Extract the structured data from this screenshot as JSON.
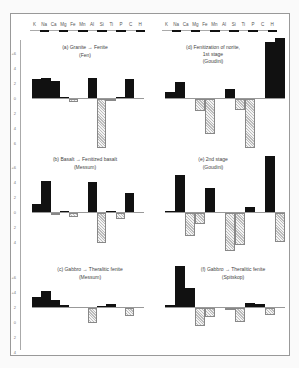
{
  "chart_data": [
    {
      "type": "bar",
      "title": "(a) Granite → Fenite",
      "subtitle": "(Fen)",
      "categories": [
        "K",
        "Na",
        "Ca",
        "Mg",
        "Fe",
        "Mn",
        "Al",
        "Si",
        "Ti",
        "P",
        "C",
        "H"
      ],
      "values": [
        2.5,
        2.7,
        2.3,
        0.2,
        -0.4,
        0.0,
        2.7,
        -6.5,
        -0.1,
        0.2,
        2.6,
        0.0
      ],
      "ylim": [
        -6,
        6
      ],
      "yticks": [
        "+6",
        "4",
        "2",
        "0",
        "2",
        "4",
        "6"
      ]
    },
    {
      "type": "bar",
      "title": "(b) Basalt → Fenitized basalt",
      "subtitle": "(Messum)",
      "categories": [
        "K",
        "Na",
        "Ca",
        "Mg",
        "Fe",
        "Mn",
        "Al",
        "Si",
        "Ti",
        "P",
        "C",
        "H"
      ],
      "values": [
        1.1,
        4.2,
        -0.3,
        0.1,
        -0.5,
        0.0,
        4.0,
        -4.0,
        0.1,
        -0.8,
        2.5,
        0.0
      ],
      "ylim": [
        -4,
        6
      ],
      "yticks": [
        "+6",
        "4",
        "2",
        "0",
        "2",
        "4"
      ]
    },
    {
      "type": "bar",
      "title": "(c) Gabbro → Theralitic fenite",
      "subtitle": "(Messum)",
      "categories": [
        "K",
        "Na",
        "Ca",
        "Mg",
        "Fe",
        "Mn",
        "Al",
        "Si",
        "Ti",
        "P",
        "C",
        "H"
      ],
      "values": [
        1.3,
        2.2,
        1.0,
        0.3,
        0.0,
        0.0,
        -2.0,
        0.2,
        0.4,
        0.0,
        -1.0,
        0.0
      ],
      "ylim": [
        -4,
        4
      ],
      "yticks": [
        "+4",
        "2",
        "0",
        "2",
        "4"
      ]
    },
    {
      "type": "bar",
      "title": "(d) Fenitization of norite, 1st stage",
      "subtitle": "(Goudini)",
      "categories": [
        "K",
        "Na",
        "Ca",
        "Mg",
        "Fe",
        "Mn",
        "Al",
        "Si",
        "Ti",
        "P",
        "C",
        "H"
      ],
      "values": [
        0.8,
        2.2,
        0.0,
        -1.6,
        -4.6,
        0.0,
        1.2,
        -1.4,
        -6.5,
        0.0,
        7.5,
        8.0
      ],
      "ylim": [
        -6,
        8
      ]
    },
    {
      "type": "bar",
      "title": "(e) 2nd stage",
      "subtitle": "(Goudini)",
      "categories": [
        "K",
        "Na",
        "Ca",
        "Mg",
        "Fe",
        "Mn",
        "Al",
        "Si",
        "Ti",
        "P",
        "C",
        "H"
      ],
      "values": [
        0.2,
        5.0,
        -3.0,
        -1.5,
        3.2,
        0.0,
        -5.0,
        -4.2,
        0.7,
        0.0,
        7.5,
        -3.8
      ],
      "ylim": [
        -6,
        8
      ]
    },
    {
      "type": "bar",
      "title": "(f) Gabbro → Theralitic fenite",
      "subtitle": "(Spitskop)",
      "categories": [
        "K",
        "Na",
        "Ca",
        "Mg",
        "Fe",
        "Mn",
        "Al",
        "Si",
        "Ti",
        "P",
        "C",
        "H"
      ],
      "values": [
        0.3,
        5.5,
        2.6,
        -2.4,
        -1.2,
        0.0,
        -0.3,
        -1.8,
        0.5,
        0.4,
        -0.9,
        0.0
      ],
      "ylim": [
        -4,
        6
      ]
    }
  ],
  "strip": {
    "elements": [
      "K",
      "Na",
      "Ca",
      "Mg",
      "Fe",
      "Mn",
      "Al",
      "Si",
      "Ti",
      "P",
      "C",
      "H"
    ],
    "underlined": [
      false,
      true,
      false,
      true,
      false,
      true,
      false,
      true,
      false,
      true,
      false,
      true
    ]
  },
  "panels": {
    "a": {
      "title": "(a) Granite → Fenite",
      "subtitle": "(Fen)"
    },
    "b": {
      "title": "(b) Basalt → Fenitized basalt",
      "subtitle": "(Messum)"
    },
    "c": {
      "title": "(c) Gabbro → Theralitic fenite",
      "subtitle": "(Messum)"
    },
    "d": {
      "title": "(d) Fenitization of norite,",
      "title2": "1st stage",
      "subtitle": "(Goudini)"
    },
    "e": {
      "title": "(e) 2nd stage",
      "subtitle": "(Goudini)"
    },
    "f": {
      "title": "(f) Gabbro → Theralitic fenite",
      "subtitle": "(Spitskop)"
    }
  },
  "axis": {
    "row1": [
      "+6",
      "4",
      "2",
      "0",
      "2",
      "4",
      "6"
    ],
    "row2": [
      "+6",
      "4",
      "2",
      "0",
      "2",
      "4"
    ],
    "row3": [
      "+6",
      "+4",
      "2",
      "0",
      "2",
      "4"
    ]
  }
}
